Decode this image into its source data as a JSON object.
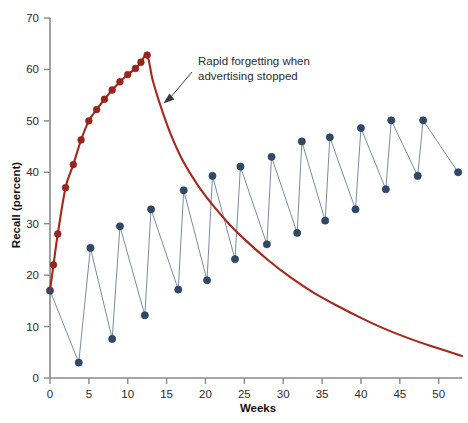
{
  "chart_data": {
    "type": "line",
    "title": "",
    "xlabel": "Weeks",
    "ylabel": "Recall (percent)",
    "xlim": [
      0,
      53
    ],
    "ylim": [
      0,
      70
    ],
    "xticks": [
      0,
      5,
      10,
      15,
      20,
      25,
      30,
      35,
      40,
      45,
      50
    ],
    "yticks": [
      0,
      10,
      20,
      30,
      40,
      50,
      60,
      70
    ],
    "grid": false,
    "legend": null,
    "annotations": [
      {
        "text_line1": "Rapid forgetting when",
        "text_line2": "advertising stopped",
        "points_to_x": 14.2,
        "points_to_y": 53.0
      }
    ],
    "series": [
      {
        "name": "continuous-advertising-then-stopped",
        "color": "#a5281d",
        "marker": "circle",
        "markers_end_x": 12.5,
        "points": [
          {
            "x": 0.0,
            "y": 17.0
          },
          {
            "x": 0.45,
            "y": 22.0
          },
          {
            "x": 1.0,
            "y": 28.0
          },
          {
            "x": 2.0,
            "y": 37.0
          },
          {
            "x": 3.0,
            "y": 41.5
          },
          {
            "x": 4.0,
            "y": 46.3
          },
          {
            "x": 5.0,
            "y": 50.0
          },
          {
            "x": 6.0,
            "y": 52.2
          },
          {
            "x": 7.0,
            "y": 54.2
          },
          {
            "x": 8.0,
            "y": 56.0
          },
          {
            "x": 9.0,
            "y": 57.6
          },
          {
            "x": 10.0,
            "y": 59.0
          },
          {
            "x": 11.0,
            "y": 60.2
          },
          {
            "x": 11.7,
            "y": 61.4
          },
          {
            "x": 12.5,
            "y": 62.8
          },
          {
            "x": 13.2,
            "y": 58.0
          },
          {
            "x": 14.2,
            "y": 53.0
          },
          {
            "x": 15.5,
            "y": 47.5
          },
          {
            "x": 17.0,
            "y": 42.5
          },
          {
            "x": 19.0,
            "y": 37.5
          },
          {
            "x": 21.0,
            "y": 33.5
          },
          {
            "x": 23.0,
            "y": 30.0
          },
          {
            "x": 25.0,
            "y": 27.0
          },
          {
            "x": 28.0,
            "y": 23.0
          },
          {
            "x": 31.0,
            "y": 19.5
          },
          {
            "x": 34.0,
            "y": 16.5
          },
          {
            "x": 37.0,
            "y": 14.0
          },
          {
            "x": 40.0,
            "y": 11.7
          },
          {
            "x": 43.0,
            "y": 9.6
          },
          {
            "x": 46.0,
            "y": 7.8
          },
          {
            "x": 49.0,
            "y": 6.2
          },
          {
            "x": 53.0,
            "y": 4.3
          }
        ]
      },
      {
        "name": "pulsed-advertising",
        "color": "#2f4a68",
        "marker": "circle",
        "points": [
          {
            "x": 0.0,
            "y": 17.0
          },
          {
            "x": 3.7,
            "y": 3.0
          },
          {
            "x": 5.2,
            "y": 25.3
          },
          {
            "x": 8.0,
            "y": 7.6
          },
          {
            "x": 9.0,
            "y": 29.5
          },
          {
            "x": 12.2,
            "y": 12.2
          },
          {
            "x": 13.0,
            "y": 32.8
          },
          {
            "x": 16.5,
            "y": 17.2
          },
          {
            "x": 17.2,
            "y": 36.5
          },
          {
            "x": 20.2,
            "y": 19.0
          },
          {
            "x": 20.9,
            "y": 39.3
          },
          {
            "x": 23.8,
            "y": 23.1
          },
          {
            "x": 24.5,
            "y": 41.1
          },
          {
            "x": 27.9,
            "y": 26.0
          },
          {
            "x": 28.5,
            "y": 43.0
          },
          {
            "x": 31.8,
            "y": 28.2
          },
          {
            "x": 32.4,
            "y": 46.0
          },
          {
            "x": 35.4,
            "y": 30.6
          },
          {
            "x": 36.0,
            "y": 46.8
          },
          {
            "x": 39.3,
            "y": 32.8
          },
          {
            "x": 40.0,
            "y": 48.6
          },
          {
            "x": 43.2,
            "y": 36.7
          },
          {
            "x": 43.9,
            "y": 50.1
          },
          {
            "x": 47.3,
            "y": 39.3
          },
          {
            "x": 48.0,
            "y": 50.1
          },
          {
            "x": 52.5,
            "y": 40.0
          }
        ]
      }
    ]
  }
}
